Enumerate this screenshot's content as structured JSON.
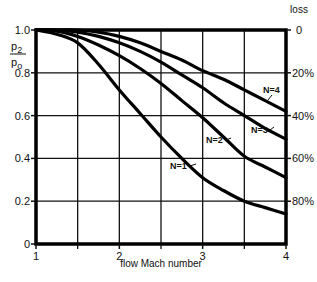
{
  "chart_data": {
    "type": "line",
    "title": "",
    "xlabel": "flow Mach number",
    "ylabel": "p2/po",
    "ylabel_num": "p",
    "ylabel_num_sub": "2",
    "ylabel_den": "p",
    "ylabel_den_sub": "o",
    "y2label": "loss",
    "xlim": [
      1,
      4
    ],
    "ylim": [
      0,
      1.0
    ],
    "grid": true,
    "x_ticks": [
      "1",
      "2",
      "3",
      "4"
    ],
    "y_ticks": [
      "0",
      "0.2",
      "0.4",
      "0.6",
      "0.8",
      "1.0"
    ],
    "y2_ticks": [
      "0",
      "20%",
      "40%",
      "60%",
      "80%"
    ],
    "x": [
      1.0,
      1.25,
      1.5,
      1.75,
      2.0,
      2.25,
      2.5,
      2.75,
      3.0,
      3.25,
      3.5,
      3.75,
      4.0
    ],
    "series": [
      {
        "name": "N=1",
        "label": "N=1",
        "values": [
          1.0,
          0.98,
          0.94,
          0.84,
          0.72,
          0.61,
          0.5,
          0.4,
          0.31,
          0.25,
          0.2,
          0.17,
          0.14
        ]
      },
      {
        "name": "N=2",
        "label": "N=2",
        "values": [
          1.0,
          0.995,
          0.97,
          0.93,
          0.88,
          0.82,
          0.75,
          0.67,
          0.59,
          0.5,
          0.41,
          0.36,
          0.31
        ]
      },
      {
        "name": "N=3",
        "label": "N=3",
        "values": [
          1.0,
          1.0,
          0.99,
          0.97,
          0.94,
          0.9,
          0.85,
          0.79,
          0.73,
          0.66,
          0.6,
          0.54,
          0.49
        ]
      },
      {
        "name": "N=4",
        "label": "N=4",
        "values": [
          1.0,
          1.0,
          1.0,
          0.99,
          0.97,
          0.94,
          0.9,
          0.86,
          0.81,
          0.77,
          0.72,
          0.67,
          0.62
        ]
      }
    ]
  }
}
